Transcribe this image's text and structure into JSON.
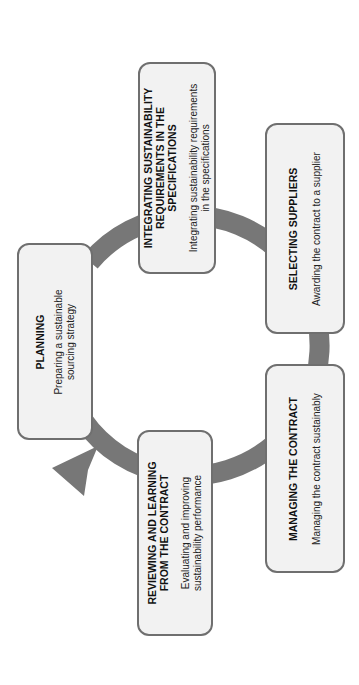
{
  "diagram": {
    "orientation": "rotated 90deg counter-clockwise",
    "colors": {
      "ring": "#777777",
      "box_fill": "#f2f2f2",
      "box_border": "#6f6f6f",
      "text": "#111111"
    },
    "steps": [
      {
        "title": "PLANNING",
        "description": "Preparing a sustainable sourcing strategy"
      },
      {
        "title": "INTEGRATING SUSTAINABILITY REQUIREMENTS IN THE SPECIFICATIONS",
        "description": "Integrating  sustainability requirements in the specifications"
      },
      {
        "title": "SELECTING SUPPLIERS",
        "description": "Awarding the contract to a supplier"
      },
      {
        "title": "MANAGING  THE CONTRACT",
        "description": "Managing the contract sustainably"
      },
      {
        "title": "REVIEWING AND LEARNING FROM THE CONTRACT",
        "description": "Evaluating  and improving sustainability performance"
      }
    ]
  }
}
